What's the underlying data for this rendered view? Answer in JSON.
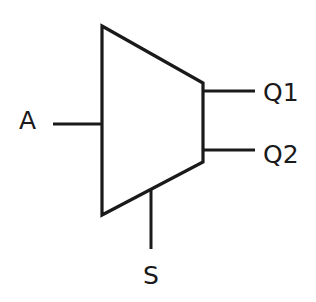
{
  "diagram": {
    "type": "demultiplexer",
    "shape": "trapezoid",
    "labels": {
      "input": "A",
      "output1": "Q1",
      "output2": "Q2",
      "select": "S"
    },
    "colors": {
      "stroke": "#1a1a1a",
      "background": "#ffffff"
    }
  }
}
